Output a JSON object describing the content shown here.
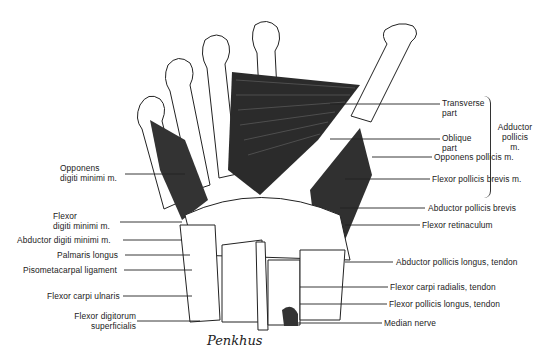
{
  "figure": {
    "signature": "Penkhus",
    "labels_right": {
      "transverse_part": "Transverse\npart",
      "oblique_part": "Oblique\npart",
      "adductor_pollicis": "Adductor\npollicis\nm.",
      "opponens_pollicis": "Opponens pollicis m.",
      "flexor_pollicis_brevis": "Flexor pollicis brevis m.",
      "abductor_pollicis_brevis": "Abductor pollicis brevis",
      "flexor_retinaculum": "Flexor retinaculum",
      "abductor_pollicis_longus": "Abductor pollicis longus, tendon",
      "flexor_carpi_radialis": "Flexor carpi radialis, tendon",
      "flexor_pollicis_longus": "Flexor pollicis longus, tendon",
      "median_nerve": "Median nerve"
    },
    "labels_left": {
      "opponens_digiti_minimi": "Opponens\ndigiti minimi m.",
      "flexor_digiti_minimi": "Flexor\ndigiti minimi m.",
      "abductor_digiti_minimi": "Abductor digiti minimi m.",
      "palmaris_longus": "Palmaris longus",
      "pisometacarpal_ligament": "Pisometacarpal ligament",
      "flexor_carpi_ulnaris": "Flexor carpi ulnaris",
      "flexor_digitorum_superficialis": "Flexor digitorum\nsuperficialis"
    },
    "colors": {
      "ink": "#1a1a1a",
      "muscle": "#2b2b2b",
      "bone": "#ffffff"
    }
  }
}
